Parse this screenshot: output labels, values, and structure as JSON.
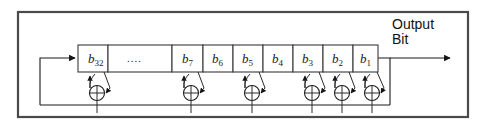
{
  "diagram": {
    "type": "lfsr-shift-register",
    "title_visible": false,
    "colors": {
      "line": "#1b1b1b",
      "frame": "#4a4a4a",
      "background": "#ffffff",
      "text": "#111111"
    },
    "frame": {
      "x": 18,
      "y": 12,
      "width": 450,
      "height": 105
    },
    "register": {
      "top": 45,
      "bottom": 72,
      "left": 78,
      "right": 378,
      "cells": [
        {
          "id": "b32",
          "base": "b",
          "sub": "32",
          "x": 78,
          "width": 30,
          "tap": true,
          "label_type": "bit"
        },
        {
          "id": "ellipsis",
          "base": "....",
          "sub": "",
          "x": 108,
          "width": 64,
          "tap": false,
          "label_type": "ellipsis"
        },
        {
          "id": "b7",
          "base": "b",
          "sub": "7",
          "x": 172,
          "width": 31,
          "tap": true,
          "label_type": "bit"
        },
        {
          "id": "b6",
          "base": "b",
          "sub": "6",
          "x": 203,
          "width": 30,
          "tap": false,
          "label_type": "bit"
        },
        {
          "id": "b5",
          "base": "b",
          "sub": "5",
          "x": 233,
          "width": 30,
          "tap": true,
          "label_type": "bit"
        },
        {
          "id": "b4",
          "base": "b",
          "sub": "4",
          "x": 263,
          "width": 30,
          "tap": false,
          "label_type": "bit"
        },
        {
          "id": "b3",
          "base": "b",
          "sub": "3",
          "x": 293,
          "width": 30,
          "tap": true,
          "label_type": "bit"
        },
        {
          "id": "b2",
          "base": "b",
          "sub": "2",
          "x": 323,
          "width": 30,
          "tap": true,
          "label_type": "bit"
        },
        {
          "id": "b1",
          "base": "b",
          "sub": "1",
          "x": 353,
          "width": 25,
          "tap": true,
          "label_type": "bit"
        }
      ]
    },
    "xor_gates": [
      {
        "id": "xor-b32",
        "cx": 97,
        "cy": 93,
        "r": 7.5
      },
      {
        "id": "xor-b7",
        "cx": 191,
        "cy": 93,
        "r": 7.5
      },
      {
        "id": "xor-b5",
        "cx": 252,
        "cy": 93,
        "r": 7.5
      },
      {
        "id": "xor-b3",
        "cx": 312,
        "cy": 93,
        "r": 7.5
      },
      {
        "id": "xor-b2",
        "cx": 342,
        "cy": 93,
        "r": 7.5
      },
      {
        "id": "xor-b1",
        "cx": 372,
        "cy": 93,
        "r": 7.5
      }
    ],
    "feedback_bus": {
      "y": 105,
      "x_start": 40,
      "x_end": 390
    },
    "feedback_path_label": "feedback-loop",
    "output": {
      "label_line1": "Output",
      "label_line2": "Bit",
      "tap_x": 390,
      "arrow_y": 58,
      "arrow_end_x": 455
    }
  }
}
